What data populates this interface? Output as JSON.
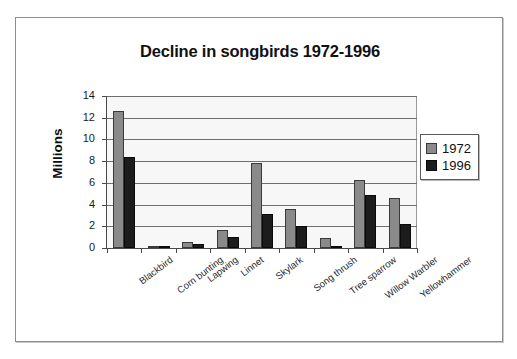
{
  "chart_data": {
    "type": "bar",
    "title": "Decline in songbirds 1972-1996",
    "xlabel": "",
    "ylabel": "Millions",
    "ylim": [
      0,
      14
    ],
    "yticks": [
      0,
      2,
      4,
      6,
      8,
      10,
      12,
      14
    ],
    "grid": true,
    "legend_position": "right",
    "categories": [
      "Blackbird",
      "Corn bunting",
      "Lapwing",
      "Linnet",
      "Skylark",
      "Song thrush",
      "Tree sparrow",
      "Willow Warbler",
      "Yellowhammer"
    ],
    "series": [
      {
        "name": "1972",
        "color": "#8a8a8a",
        "values": [
          12.6,
          0.2,
          0.6,
          1.7,
          7.8,
          3.6,
          0.9,
          6.3,
          4.6
        ]
      },
      {
        "name": "1996",
        "color": "#1c1c1c",
        "values": [
          8.4,
          0.1,
          0.4,
          1.0,
          3.1,
          2.0,
          0.05,
          4.9,
          2.2
        ]
      }
    ]
  },
  "legend": {
    "items": [
      {
        "label": "1972",
        "swatch": "light-gray-swatch"
      },
      {
        "label": "1996",
        "swatch": "dark-swatch"
      }
    ]
  }
}
